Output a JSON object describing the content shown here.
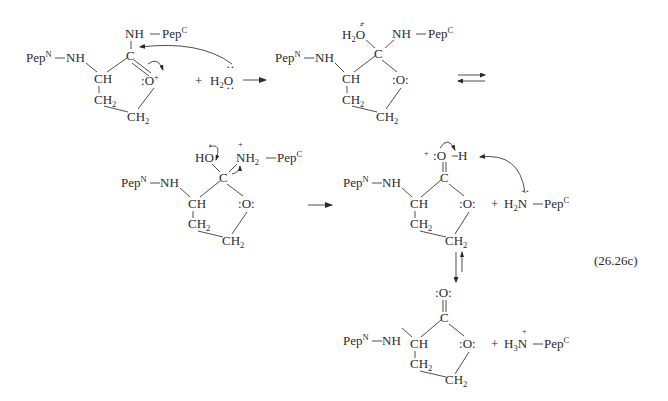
{
  "figure": {
    "equation_label": "(26.26c)"
  },
  "labels": {
    "pepN": "Pep",
    "pepN_sup": "N",
    "pepC": "Pep",
    "pepC_sup": "C",
    "NH": "NH",
    "CH": "CH",
    "CH2": "CH",
    "sub2": "2",
    "sub3": "3",
    "C": "C",
    "O": "O",
    "H": "H",
    "HO": "HO",
    "H2O_H": "H",
    "N": "N",
    "plus_sign": "+",
    "charge_plus": "+",
    "lone_pair_colon": ":",
    "dash": "—"
  },
  "structures": [
    {
      "id": "s1",
      "name": "cyclic-iminium-ester",
      "charge": "O+",
      "position": "top-left"
    },
    {
      "id": "s2",
      "name": "tetrahedral-intermediate-oxonium",
      "charge": "H2O+",
      "position": "top-middle"
    },
    {
      "id": "s3",
      "name": "tetrahedral-intermediate-ammonium",
      "charge": "NH2+",
      "position": "middle-left"
    },
    {
      "id": "s4",
      "name": "protonated-lactone",
      "charge": "O+H",
      "position": "middle-right"
    },
    {
      "id": "s5",
      "name": "lactone-product",
      "charge": "none",
      "position": "bottom-right"
    }
  ],
  "reagents": {
    "water": "H",
    "water_sub": "2",
    "water_O": "O",
    "amine_H2N": "H",
    "amine_H3N": "H"
  },
  "arrows": [
    {
      "type": "forward",
      "from": "s1",
      "to": "s2"
    },
    {
      "type": "equilibrium",
      "from": "s2",
      "to": "s3"
    },
    {
      "type": "forward",
      "from": "s3",
      "to": "s4"
    },
    {
      "type": "equilibrium-vertical",
      "from": "s4",
      "to": "s5"
    }
  ]
}
